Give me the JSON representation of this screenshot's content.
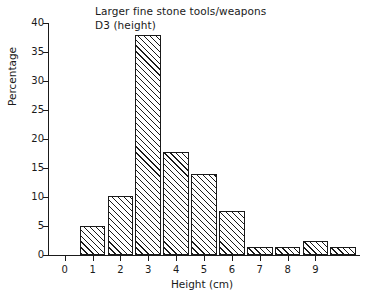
{
  "chart_data": {
    "type": "bar",
    "title": "Larger fine stone tools/weapons",
    "subtitle": "D3 (height)",
    "xlabel": "Height (cm)",
    "ylabel": "Percentage",
    "categories": [
      "1",
      "2",
      "3",
      "4",
      "5",
      "6",
      "7",
      "8",
      "9",
      "10"
    ],
    "values": [
      5.0,
      10.1,
      38.0,
      17.7,
      14.0,
      7.6,
      1.3,
      1.3,
      2.4,
      1.3
    ],
    "ylim": [
      0,
      40
    ],
    "yticks": [
      0,
      5,
      10,
      15,
      20,
      25,
      30,
      35,
      40
    ],
    "ytick_labels": [
      "0",
      "5",
      "10",
      "15",
      "20",
      "25",
      "30",
      "35",
      "40"
    ],
    "xlim": [
      -0.6,
      10.6
    ],
    "xticks": [
      0,
      1,
      2,
      3,
      4,
      5,
      6,
      7,
      8,
      9
    ],
    "xtick_labels": [
      "0",
      "1",
      "2",
      "3",
      "4",
      "5",
      "6",
      "7",
      "8",
      "9"
    ],
    "grid": false,
    "legend": false,
    "bar_fill": "diagonal-hatch",
    "line_color": "#1a1a1a",
    "background": "#ffffff"
  }
}
